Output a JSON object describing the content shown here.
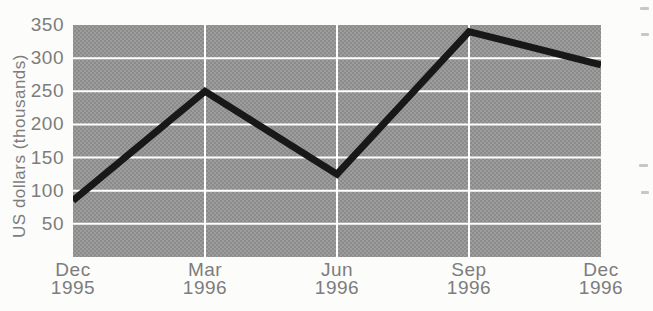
{
  "page": {
    "background": "#fcfcfa"
  },
  "chart_data": {
    "type": "line",
    "title": "",
    "xlabel": "",
    "ylabel": "US dollars (thousands)",
    "categories": [
      "Dec 1995",
      "Mar 1996",
      "Jun 1996",
      "Sep 1996",
      "Dec 1996"
    ],
    "values": [
      85,
      250,
      125,
      340,
      290
    ],
    "ylim": [
      0,
      350
    ],
    "yticks": [
      50,
      100,
      150,
      200,
      250,
      300,
      350
    ],
    "grid": "white horizontal gridline at each y tick, white vertical gridline at interior x ticks",
    "legend_position": "none",
    "style": {
      "plot_background": "#9d9d9d",
      "plot_halftone_dot": "#8b8b8b",
      "gridline_color": "#ffffff",
      "gridline_width_px": 2,
      "series_line_color": "#181818",
      "series_line_width_px": 7,
      "tick_label_color": "#7d7d7d"
    }
  },
  "scan_artifacts": [
    {
      "x": 640,
      "y": 7,
      "w": 9,
      "h": 3
    },
    {
      "x": 641,
      "y": 33,
      "w": 8,
      "h": 3
    },
    {
      "x": 639,
      "y": 164,
      "w": 9,
      "h": 3
    },
    {
      "x": 641,
      "y": 191,
      "w": 8,
      "h": 3
    }
  ]
}
